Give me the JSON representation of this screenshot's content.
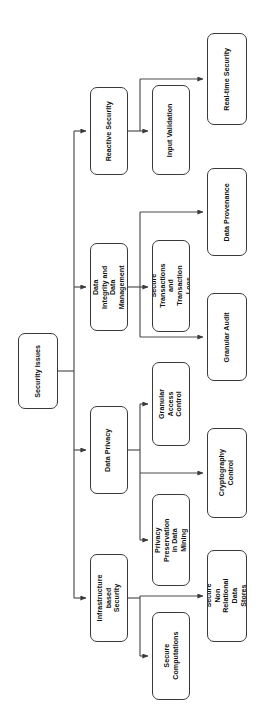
{
  "diagram": {
    "title": "Security Issues",
    "type": "hierarchy-tree",
    "orientation": "rotated-90-clockwise",
    "colors": {
      "background": "#ffffff",
      "node_border": "#3a3a3a",
      "node_fill": "#ffffff",
      "connector": "#4a4a4a",
      "text": "#111111"
    },
    "root": {
      "id": "security-issues",
      "label": "Security Issues",
      "box": {
        "x": 18,
        "y": 333,
        "w": 40,
        "h": 76
      }
    },
    "level1": [
      {
        "id": "reactive-security",
        "label": "Reactive Security",
        "box": {
          "x": 90,
          "y": 87,
          "w": 38,
          "h": 88
        }
      },
      {
        "id": "data-integrity-and-data-management",
        "label": "Data Integrity and Data Management",
        "box": {
          "x": 90,
          "y": 243,
          "w": 38,
          "h": 88
        }
      },
      {
        "id": "data-privacy",
        "label": "Data Privacy",
        "box": {
          "x": 90,
          "y": 406,
          "w": 38,
          "h": 88
        }
      },
      {
        "id": "infrastructure-based-security",
        "label": "Infrastructure based Security",
        "box": {
          "x": 90,
          "y": 554,
          "w": 38,
          "h": 88
        }
      }
    ],
    "level2": [
      {
        "id": "input-validation",
        "label": "Input Validation",
        "parent": "reactive-security",
        "box": {
          "x": 152,
          "y": 85,
          "w": 38,
          "h": 90
        }
      },
      {
        "id": "secure-transactions-and-transaction-logs",
        "label": "Secure Transactions and Transaction Logs",
        "parent": "data-integrity-and-data-management",
        "box": {
          "x": 152,
          "y": 240,
          "w": 38,
          "h": 92
        }
      },
      {
        "id": "granular-access-control",
        "label": "Granular Access Control",
        "parent": "data-privacy",
        "box": {
          "x": 152,
          "y": 362,
          "w": 38,
          "h": 84
        }
      },
      {
        "id": "privacy-preservation-in-data-mining",
        "label": "Privacy Preservation in Data Mining",
        "parent": "data-privacy",
        "box": {
          "x": 152,
          "y": 494,
          "w": 38,
          "h": 92
        }
      },
      {
        "id": "secure-computations",
        "label": "Secure Computations",
        "parent": "infrastructure-based-security",
        "box": {
          "x": 152,
          "y": 612,
          "w": 38,
          "h": 88
        }
      }
    ],
    "level3": [
      {
        "id": "real-time-security",
        "label": "Real-time Security",
        "parent": "reactive-security",
        "box": {
          "x": 207,
          "y": 33,
          "w": 40,
          "h": 92
        }
      },
      {
        "id": "data-provenance",
        "label": "Data Provenance",
        "parent": "data-integrity-and-data-management",
        "box": {
          "x": 207,
          "y": 168,
          "w": 40,
          "h": 88
        }
      },
      {
        "id": "granular-audit",
        "label": "Granular Audit",
        "parent": "data-integrity-and-data-management",
        "box": {
          "x": 207,
          "y": 293,
          "w": 40,
          "h": 88
        }
      },
      {
        "id": "cryptography-control",
        "label": "Cryptography Control",
        "parent": "data-privacy",
        "box": {
          "x": 207,
          "y": 428,
          "w": 40,
          "h": 90
        }
      },
      {
        "id": "secure-non-relational-data-stores",
        "label": "Secure Non Relational Data Stores",
        "parent": "infrastructure-based-security",
        "box": {
          "x": 207,
          "y": 550,
          "w": 40,
          "h": 92
        }
      }
    ]
  }
}
